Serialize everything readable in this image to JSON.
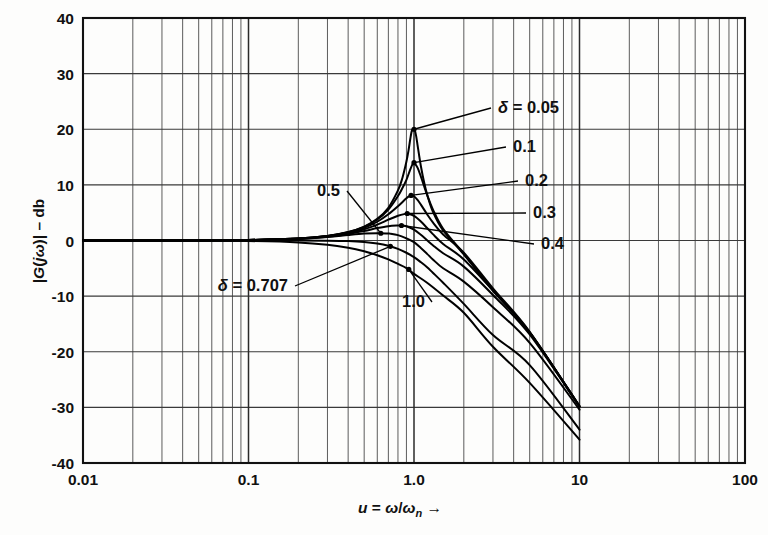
{
  "figure": {
    "kind": "bode-magnitude-plot",
    "background_color": "#fdfdfc",
    "ink_color": "#000000"
  },
  "axes": {
    "y_title": "|G( jω)| – db",
    "x_title": "u = ω/ωn",
    "x_title_arrow": "→"
  },
  "ticks": {
    "y": [
      "40",
      "30",
      "20",
      "10",
      "0",
      "-10",
      "-20",
      "-30",
      "-40"
    ],
    "x": [
      "0.01",
      "0.1",
      "1.0",
      "10",
      "100"
    ]
  },
  "curve_labels": [
    {
      "id": "d005",
      "text": "δ = 0.05"
    },
    {
      "id": "d01",
      "text": "0.1"
    },
    {
      "id": "d02",
      "text": "0.2"
    },
    {
      "id": "d03",
      "text": "0.3"
    },
    {
      "id": "d04",
      "text": "0.4"
    },
    {
      "id": "d05",
      "text": "0.5"
    },
    {
      "id": "d0707",
      "text": "δ = 0.707"
    },
    {
      "id": "d10",
      "text": "1.0"
    }
  ],
  "chart_data": {
    "type": "line",
    "title": "",
    "xlabel": "u = ω/ωn",
    "ylabel": "|G( jω)| – db",
    "xscale": "log",
    "xlim": [
      0.01,
      100
    ],
    "ylim": [
      -40,
      40
    ],
    "xticks": [
      0.01,
      0.1,
      1,
      10,
      100
    ],
    "yticks": [
      -40,
      -30,
      -20,
      -10,
      0,
      10,
      20,
      30,
      40
    ],
    "grid": true,
    "grid_minor_x": true,
    "legend": "inline-annotations",
    "equation": "|G(ju)| = 1 / sqrt((1-u^2)^2 + (2*delta*u)^2)",
    "series": [
      {
        "name": "δ = 0.05",
        "delta": 0.05,
        "peak_db": 20.0,
        "peak_u": 0.9975,
        "x": [
          0.01,
          0.02,
          0.05,
          0.1,
          0.2,
          0.3,
          0.4,
          0.5,
          0.6,
          0.7,
          0.8,
          0.85,
          0.9,
          0.93,
          0.95,
          0.97,
          0.99,
          1.0,
          1.01,
          1.03,
          1.05,
          1.07,
          1.1,
          1.15,
          1.2,
          1.3,
          1.5,
          2.0,
          3.0,
          5.0,
          10.0
        ],
        "y": [
          0.0,
          0.0,
          0.02,
          0.09,
          0.35,
          0.83,
          1.53,
          2.51,
          3.89,
          5.89,
          9.0,
          11.2,
          14.2,
          16.5,
          18.3,
          19.7,
          20.0,
          20.0,
          19.9,
          18.8,
          17.2,
          15.6,
          13.4,
          10.5,
          8.3,
          5.2,
          1.8,
          -2.5,
          -9.0,
          -16.6,
          -29.8
        ]
      },
      {
        "name": "0.1",
        "delta": 0.1,
        "peak_db": 14.0,
        "peak_u": 0.99,
        "x": [
          0.01,
          0.05,
          0.1,
          0.2,
          0.3,
          0.4,
          0.5,
          0.6,
          0.7,
          0.8,
          0.85,
          0.9,
          0.95,
          0.99,
          1.0,
          1.05,
          1.1,
          1.15,
          1.2,
          1.3,
          1.5,
          2.0,
          3.0,
          5.0,
          10.0
        ],
        "y": [
          0.0,
          0.02,
          0.09,
          0.35,
          0.82,
          1.51,
          2.45,
          3.77,
          5.57,
          8.0,
          9.4,
          10.9,
          12.8,
          14.0,
          14.0,
          13.1,
          11.5,
          9.8,
          8.2,
          5.6,
          2.1,
          -2.4,
          -8.9,
          -16.5,
          -29.8
        ]
      },
      {
        "name": "0.2",
        "delta": 0.2,
        "peak_db": 8.1,
        "peak_u": 0.959,
        "x": [
          0.01,
          0.05,
          0.1,
          0.2,
          0.3,
          0.4,
          0.5,
          0.6,
          0.7,
          0.8,
          0.9,
          0.95,
          0.96,
          1.0,
          1.05,
          1.1,
          1.2,
          1.3,
          1.5,
          2.0,
          3.0,
          5.0,
          10.0
        ],
        "y": [
          0.0,
          0.02,
          0.09,
          0.34,
          0.79,
          1.44,
          2.28,
          3.37,
          4.71,
          6.16,
          7.58,
          8.06,
          8.1,
          7.96,
          7.31,
          6.45,
          4.73,
          3.26,
          1.08,
          -2.2,
          -8.6,
          -16.4,
          -29.8
        ]
      },
      {
        "name": "0.3",
        "delta": 0.3,
        "peak_db": 4.85,
        "peak_u": 0.906,
        "x": [
          0.01,
          0.05,
          0.1,
          0.2,
          0.3,
          0.4,
          0.5,
          0.6,
          0.7,
          0.8,
          0.9,
          0.91,
          1.0,
          1.1,
          1.2,
          1.3,
          1.5,
          2.0,
          3.0,
          5.0,
          10.0
        ],
        "y": [
          0.0,
          0.02,
          0.09,
          0.33,
          0.75,
          1.32,
          2.02,
          2.86,
          3.74,
          4.45,
          4.84,
          4.85,
          4.44,
          3.42,
          2.24,
          1.14,
          -0.63,
          -3.4,
          -9.0,
          -16.5,
          -29.8
        ]
      },
      {
        "name": "0.4",
        "delta": 0.4,
        "peak_db": 2.7,
        "peak_u": 0.825,
        "x": [
          0.01,
          0.05,
          0.1,
          0.2,
          0.3,
          0.4,
          0.5,
          0.6,
          0.7,
          0.8,
          0.83,
          0.9,
          1.0,
          1.1,
          1.2,
          1.3,
          1.5,
          2.0,
          3.0,
          5.0,
          10.0
        ],
        "y": [
          0.0,
          0.02,
          0.09,
          0.31,
          0.69,
          1.18,
          1.72,
          2.23,
          2.58,
          2.7,
          2.7,
          2.55,
          1.94,
          1.02,
          0.05,
          -0.85,
          -2.3,
          -4.7,
          -9.8,
          -16.9,
          -29.9
        ]
      },
      {
        "name": "0.5",
        "delta": 0.5,
        "peak_db": 1.25,
        "peak_u": 0.707,
        "x": [
          0.01,
          0.05,
          0.1,
          0.2,
          0.3,
          0.4,
          0.5,
          0.6,
          0.7,
          0.71,
          0.8,
          0.9,
          1.0,
          1.1,
          1.2,
          1.3,
          1.5,
          2.0,
          3.0,
          5.0,
          10.0
        ],
        "y": [
          0.0,
          0.01,
          0.09,
          0.29,
          0.62,
          1.0,
          1.25,
          1.3,
          1.25,
          1.25,
          0.97,
          0.39,
          -0.3,
          -1.35,
          -2.4,
          -3.4,
          -5.0,
          -7.4,
          -12.0,
          -18.4,
          -30.4
        ]
      },
      {
        "name": "δ = 0.707",
        "delta": 0.707,
        "peak_db": 0.0,
        "peak_u": 0.0,
        "x": [
          0.01,
          0.05,
          0.1,
          0.2,
          0.3,
          0.4,
          0.5,
          0.6,
          0.7,
          0.8,
          0.9,
          1.0,
          1.1,
          1.2,
          1.3,
          1.5,
          2.0,
          3.0,
          5.0,
          10.0
        ],
        "y": [
          0.0,
          0.0,
          0.0,
          -0.02,
          -0.04,
          -0.11,
          -0.27,
          -0.55,
          -0.95,
          -1.5,
          -2.2,
          -3.0,
          -3.9,
          -4.8,
          -5.8,
          -7.6,
          -11.4,
          -17.0,
          -22.4,
          -34.0
        ]
      },
      {
        "name": "1.0",
        "delta": 1.0,
        "peak_db": 0.0,
        "peak_u": 0.0,
        "x": [
          0.01,
          0.05,
          0.1,
          0.2,
          0.3,
          0.4,
          0.5,
          0.6,
          0.7,
          0.8,
          0.9,
          1.0,
          1.2,
          1.5,
          2.0,
          3.0,
          5.0,
          10.0
        ],
        "y": [
          0.0,
          -0.01,
          -0.09,
          -0.34,
          -0.75,
          -1.3,
          -1.94,
          -2.65,
          -3.4,
          -4.2,
          -4.95,
          -6.0,
          -7.6,
          -9.9,
          -13.0,
          -19.1,
          -25.6,
          -35.8
        ]
      }
    ]
  }
}
